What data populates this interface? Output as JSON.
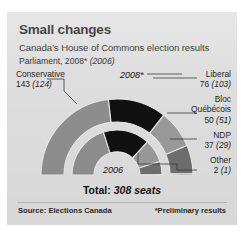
{
  "header": {
    "title": "Small changes",
    "subtitle": "Canada’s House of Commons election results",
    "parliament_prefix": "Parliament, 2008* ",
    "parliament_prev": "(2006)"
  },
  "chart_data": {
    "type": "pie",
    "variant": "semi-donut-nested",
    "title": "Small changes",
    "subtitle": "Canada’s House of Commons election results",
    "categories": [
      "Conservative",
      "Liberal",
      "Bloc Québécois",
      "NDP",
      "Other"
    ],
    "series": [
      {
        "name": "2008*",
        "ring": "outer",
        "values": [
          143,
          76,
          50,
          37,
          2
        ],
        "total": 308
      },
      {
        "name": "2006",
        "ring": "inner",
        "values": [
          124,
          103,
          51,
          29,
          1
        ],
        "total": 308
      }
    ],
    "colors": [
      "#8e8e8e",
      "#111111",
      "#9a9a9a",
      "#6f6f6f",
      "#3a3a3a"
    ],
    "ring_labels": {
      "outer": "2008*",
      "inner": "2006"
    },
    "total_label": "Total: ",
    "total_value": "308 seats",
    "legend_position": "callouts",
    "grid": false
  },
  "labels": {
    "conservative": {
      "name": "Conservative",
      "value": "143",
      "prev": "(124)"
    },
    "liberal": {
      "name": "Liberal",
      "value": "76",
      "prev": "(103)"
    },
    "bloc": {
      "name": "Bloc",
      "name2": "Québécois",
      "value": "50",
      "prev": "(51)"
    },
    "ndp": {
      "name": "NDP",
      "value": "37",
      "prev": "(29)"
    },
    "other": {
      "name": "Other",
      "value": "2",
      "prev": "(1)"
    }
  },
  "rings": {
    "outer": "2008*",
    "inner": "2006"
  },
  "footer": {
    "total_prefix": "Total: ",
    "total_value": "308 seats",
    "source": "Source: Elections Canada",
    "note": "*Preliminary results"
  }
}
